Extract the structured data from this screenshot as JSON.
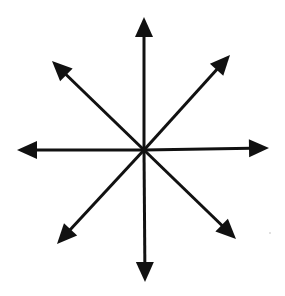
{
  "diagram": {
    "type": "radial-arrows",
    "center": {
      "x": 144,
      "y": 150
    },
    "color": "#111111",
    "background": "#ffffff",
    "stroke_width": 3,
    "arrowhead": {
      "length": 20,
      "half_width": 9
    },
    "arrows": [
      {
        "name": "arrow-up",
        "direction": "N",
        "tip": {
          "x": 144,
          "y": 17
        }
      },
      {
        "name": "arrow-up-right",
        "direction": "NE",
        "tip": {
          "x": 230,
          "y": 55
        }
      },
      {
        "name": "arrow-right",
        "direction": "E",
        "tip": {
          "x": 269,
          "y": 148
        }
      },
      {
        "name": "arrow-down-right",
        "direction": "SE",
        "tip": {
          "x": 236,
          "y": 239
        }
      },
      {
        "name": "arrow-down",
        "direction": "S",
        "tip": {
          "x": 145,
          "y": 282
        }
      },
      {
        "name": "arrow-down-left",
        "direction": "SW",
        "tip": {
          "x": 57,
          "y": 244
        }
      },
      {
        "name": "arrow-left",
        "direction": "W",
        "tip": {
          "x": 17,
          "y": 150
        }
      },
      {
        "name": "arrow-up-left",
        "direction": "NW",
        "tip": {
          "x": 52,
          "y": 61
        }
      }
    ]
  }
}
